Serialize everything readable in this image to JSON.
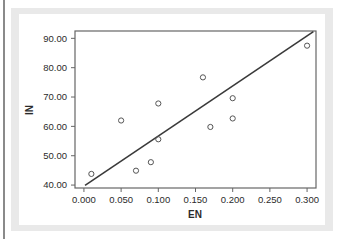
{
  "figure": {
    "background_color": "#ffffff",
    "mat_color": "#e9e9e9",
    "frame_color": "#666666",
    "left_rule_color": "#8a8a8a"
  },
  "chart_data": {
    "type": "scatter",
    "title": "",
    "subtitle": "",
    "xlabel": "EN",
    "ylabel": "IN",
    "xlim": [
      -0.012,
      0.312
    ],
    "ylim": [
      39.0,
      92.5
    ],
    "grid": false,
    "legend": null,
    "x_tick_labels": [
      "0.000",
      "0.050",
      "0.100",
      "0.150",
      "0.200",
      "0.250",
      "0.300"
    ],
    "x_tick_values": [
      0.0,
      0.05,
      0.1,
      0.15,
      0.2,
      0.25,
      0.3
    ],
    "y_tick_labels": [
      "40.00",
      "50.00",
      "60.00",
      "70.00",
      "80.00",
      "90.00"
    ],
    "y_tick_values": [
      40,
      50,
      60,
      70,
      80,
      90
    ],
    "marker": {
      "shape": "open-circle",
      "edge_color": "#555555",
      "fill_color": "none",
      "radius": 2.6
    },
    "points": [
      {
        "x": 0.01,
        "y": 43.8
      },
      {
        "x": 0.05,
        "y": 62.0
      },
      {
        "x": 0.07,
        "y": 44.9
      },
      {
        "x": 0.09,
        "y": 47.8
      },
      {
        "x": 0.1,
        "y": 55.6
      },
      {
        "x": 0.1,
        "y": 67.8
      },
      {
        "x": 0.16,
        "y": 76.7
      },
      {
        "x": 0.17,
        "y": 59.8
      },
      {
        "x": 0.2,
        "y": 62.7
      },
      {
        "x": 0.2,
        "y": 69.6
      },
      {
        "x": 0.3,
        "y": 87.5
      }
    ],
    "fit_line": {
      "name": "linear-fit",
      "color": "#3a3a3a",
      "width": 1.6,
      "x_start": 0.0015,
      "y_start": 39.9,
      "x_end": 0.3085,
      "y_end": 92.3
    }
  }
}
